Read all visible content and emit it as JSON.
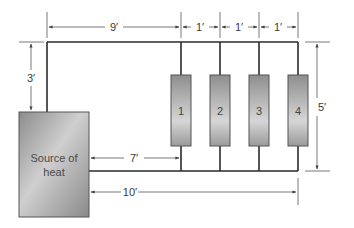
{
  "diagram": {
    "type": "heating-piping-layout",
    "source": {
      "label_line1": "Source of",
      "label_line2": "heat"
    },
    "radiators": [
      {
        "label": "1"
      },
      {
        "label": "2"
      },
      {
        "label": "3"
      },
      {
        "label": "4"
      }
    ],
    "dimensions": {
      "source_to_rad1_top": "9′",
      "rad1_to_rad2": "1′",
      "rad2_to_rad3": "1′",
      "rad3_to_rad4": "1′",
      "source_rise": "3′",
      "loop_height": "5′",
      "source_to_rad1_return": "7′",
      "source_to_rad4_return": "10′"
    },
    "colors": {
      "pipe": "#2a2a2a",
      "dimension_line": "#555555",
      "box_fill_dark": "#8e8e8e",
      "box_fill_light": "#d4d4d4",
      "box_stroke": "#555555"
    }
  }
}
